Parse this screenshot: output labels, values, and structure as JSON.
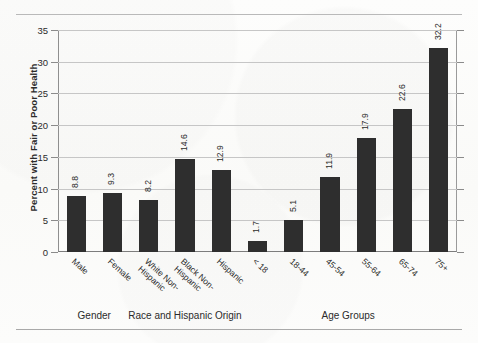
{
  "chart_data": {
    "type": "bar",
    "title": "",
    "xlabel": "",
    "ylabel": "Percent with Fair or Poor Health",
    "ylim": [
      0,
      35
    ],
    "yticks": [
      0,
      5,
      10,
      15,
      20,
      25,
      30,
      35
    ],
    "grid": true,
    "legend": "none",
    "categories": [
      "Male",
      "Female",
      "White Non-\nHispanic",
      "Black Non-\nHispanic",
      "Hispanic",
      "< 18",
      "18-44",
      "45-54",
      "55-64",
      "65-74",
      "75+"
    ],
    "values": [
      8.8,
      9.3,
      8.2,
      14.6,
      12.9,
      1.7,
      5.1,
      11.9,
      17.9,
      22.6,
      32.2
    ],
    "value_labels": [
      "8.8",
      "9.3",
      "8.2",
      "14.6",
      "12.9",
      "1.7",
      "5.1",
      "11.9",
      "17.9",
      "22.6",
      "32.2"
    ],
    "bar_color": "#2e2e2e",
    "groups": [
      {
        "label": "Gender",
        "categories": [
          "Male",
          "Female"
        ]
      },
      {
        "label": "Race and Hispanic Origin",
        "categories": [
          "White Non-Hispanic",
          "Black Non-Hispanic",
          "Hispanic"
        ]
      },
      {
        "label": "Age Groups",
        "categories": [
          "< 18",
          "18-44",
          "45-54",
          "55-64",
          "65-74",
          "75+"
        ]
      }
    ]
  },
  "axis": {
    "y_title": "Percent with Fair or Poor Health",
    "tick_labels": [
      "35",
      "30",
      "25",
      "20",
      "15",
      "10",
      "5",
      "0"
    ]
  },
  "categories_display": [
    {
      "line1": "Male",
      "line2": ""
    },
    {
      "line1": "Female",
      "line2": ""
    },
    {
      "line1": "White Non-",
      "line2": "Hispanic"
    },
    {
      "line1": "Black Non-",
      "line2": "Hispanic"
    },
    {
      "line1": "Hispanic",
      "line2": ""
    },
    {
      "line1": "< 18",
      "line2": ""
    },
    {
      "line1": "18-44",
      "line2": ""
    },
    {
      "line1": "45-54",
      "line2": ""
    },
    {
      "line1": "55-64",
      "line2": ""
    },
    {
      "line1": "65-74",
      "line2": ""
    },
    {
      "line1": "75+",
      "line2": ""
    }
  ],
  "group_captions": [
    {
      "label": "Gender"
    },
    {
      "label": "Race and Hispanic Origin"
    },
    {
      "label": "Age Groups"
    }
  ],
  "colors": {
    "bar": "#2e2e2e",
    "grid": "#c6c6c6",
    "axis": "#8b8b8b",
    "background": "#fcfcfb"
  }
}
